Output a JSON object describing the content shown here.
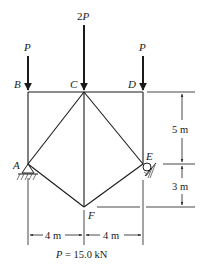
{
  "diagram": {
    "type": "truss",
    "nodes": {
      "A": {
        "label": "A"
      },
      "B": {
        "label": "B"
      },
      "C": {
        "label": "C"
      },
      "D": {
        "label": "D"
      },
      "E": {
        "label": "E"
      },
      "F": {
        "label": "F"
      }
    },
    "loads": {
      "B": {
        "label": "P"
      },
      "C": {
        "label_coef": "2",
        "label_var": "P"
      },
      "D": {
        "label": "P"
      }
    },
    "dimensions": {
      "upper_height": "5 m",
      "lower_height": "3 m",
      "left_span": "4 m",
      "right_span": "4 m"
    },
    "caption": {
      "var": "P",
      "equals": " = 15.0 kN"
    },
    "supports": {
      "A": "pin",
      "E": "roller"
    },
    "colors": {
      "line": "#1a1a1a",
      "background": "#ffffff"
    }
  }
}
